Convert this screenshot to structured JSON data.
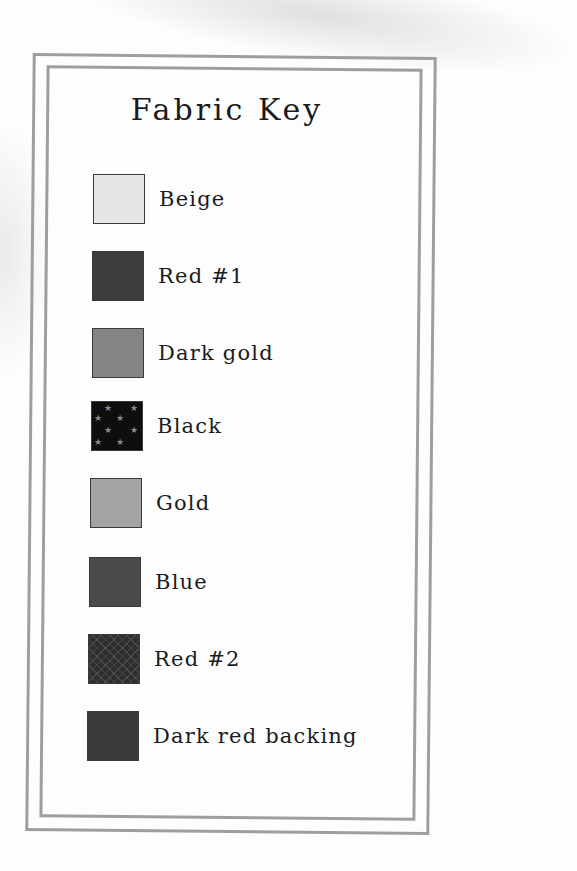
{
  "title": "Fabric Key",
  "items": [
    {
      "label": "Beige",
      "color": "#e6e6e6",
      "pattern": "solid"
    },
    {
      "label": "Red #1",
      "color": "#3c3c3c",
      "pattern": "solid"
    },
    {
      "label": "Dark gold",
      "color": "#848484",
      "pattern": "solid"
    },
    {
      "label": "Black",
      "color": "#0e0e0e",
      "pattern": "stars"
    },
    {
      "label": "Gold",
      "color": "#a3a3a3",
      "pattern": "solid"
    },
    {
      "label": "Blue",
      "color": "#4b4b4b",
      "pattern": "solid"
    },
    {
      "label": "Red #2",
      "color": "#2e2e2e",
      "pattern": "leaves"
    },
    {
      "label": "Dark red backing",
      "color": "#3a3a3a",
      "pattern": "solid"
    }
  ]
}
